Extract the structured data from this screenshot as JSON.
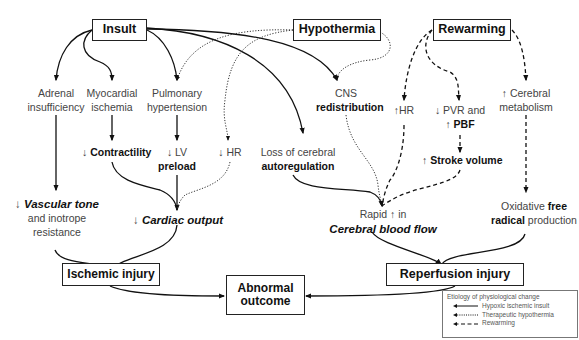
{
  "boxes": {
    "insult": "Insult",
    "hypothermia": "Hypothermia",
    "rewarming": "Rewarming",
    "ischemic_injury": "Ischemic injury",
    "reperfusion_injury": "Reperfusion injury",
    "abnormal_outcome_line1": "Abnormal",
    "abnormal_outcome_line2": "outcome"
  },
  "nodes": {
    "adrenal_1": "Adrenal",
    "adrenal_2": "insufficiency",
    "myocardial_1": "Myocardial",
    "myocardial_2": "ischemia",
    "pulmonary_1": "Pulmonary",
    "pulmonary_2": "hypertension",
    "cns_1": "CNS",
    "cns_2": "redistribution",
    "hr_up": "↑HR",
    "pvr_1": "↓ PVR and",
    "pbf_arrow": "↑ ",
    "pbf": "PBF",
    "cereb_met_1": "↑ Cerebral",
    "cereb_met_2": "metabolism",
    "contractility_arrow": "↓ ",
    "contractility": "Contractility",
    "lv_1": "↓ LV",
    "lv_2": "preload",
    "hr_down": "↓ HR",
    "loss_1": "Loss of cerebral",
    "loss_2": "autoregulation",
    "stroke_arrow": "↑ ",
    "stroke": "Stroke volume",
    "vascular_arrow": "↓ ",
    "vascular": "Vascular tone",
    "vascular_2": "and inotrope",
    "vascular_3": "resistance",
    "cardiac_arrow": "↓ ",
    "cardiac": "Cardiac output",
    "rapid": "Rapid ↑ in",
    "cbf": "Cerebral blood flow",
    "oxid_pre": "Oxidative ",
    "oxid_free": "free",
    "oxid_radical": "radical",
    "oxid_post": " production"
  },
  "legend": {
    "title": "Etiology of physiological change",
    "items": [
      {
        "style": "solid",
        "label": "Hypoxic ischemic insult"
      },
      {
        "style": "dotted",
        "label": "Therapeutic hypothermia"
      },
      {
        "style": "dashed",
        "label": "Rewarming"
      }
    ]
  }
}
